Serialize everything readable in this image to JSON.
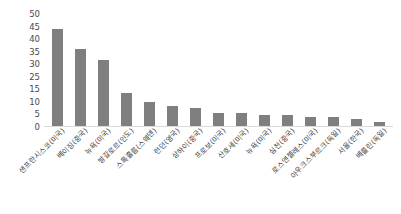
{
  "chart_data": {
    "type": "bar",
    "title": "",
    "subtitle": "",
    "xlabel": "",
    "ylabel": "",
    "ylim": [
      0,
      50
    ],
    "grid": false,
    "legend": null,
    "bar_color": "#7f7f7f",
    "axis_text_color": "#4a4a4a",
    "y_ticks": [
      "50",
      "45",
      "40",
      "35",
      "30",
      "25",
      "15",
      "10",
      "5",
      "0"
    ],
    "y_tick_values": [
      50,
      45,
      40,
      35,
      30,
      25,
      15,
      10,
      5,
      0
    ],
    "categories": [
      "샌프란시스코(미국)",
      "베이징(중국)",
      "뉴욕(미국)",
      "방갈로르(인도)",
      "스톡홀름(스웨덴)",
      "런던(영국)",
      "상하이(중국)",
      "프로보(미국)",
      "산호세(미국)",
      "뉴욕(미국)",
      "심천(중국)",
      "로스앤젤레스(미국)",
      "아우크스부르크(독일)",
      "서울(한국)",
      "베를린(독일)"
    ],
    "values": [
      44,
      35,
      30,
      15,
      11,
      9,
      8,
      6,
      6,
      5,
      5,
      4,
      4,
      3,
      2
    ]
  }
}
